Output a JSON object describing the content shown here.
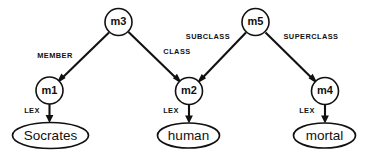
{
  "diagram": {
    "background_color": "#ffffff",
    "stroke_color": "#111111",
    "concept_nodes": [
      {
        "id": "m3",
        "label": "m3",
        "cx": 118.5,
        "cy": 22,
        "r": 13.5
      },
      {
        "id": "m5",
        "label": "m5",
        "cx": 255.5,
        "cy": 22,
        "r": 13.5
      },
      {
        "id": "m1",
        "label": "m1",
        "cx": 49.5,
        "cy": 90.5,
        "r": 13.5
      },
      {
        "id": "m2",
        "label": "m2",
        "cx": 189.0,
        "cy": 91.0,
        "r": 13.5
      },
      {
        "id": "m4",
        "label": "m4",
        "cx": 325.0,
        "cy": 91.0,
        "r": 13.5
      }
    ],
    "lexical_nodes": [
      {
        "id": "socrates",
        "label": "Socrates",
        "cx": 50.5,
        "cy": 135.5,
        "rx": 38,
        "ry": 13
      },
      {
        "id": "human",
        "label": "human",
        "cx": 188.5,
        "cy": 135.5,
        "rx": 31,
        "ry": 12.5
      },
      {
        "id": "mortal",
        "label": "mortal",
        "cx": 324.5,
        "cy": 135.5,
        "rx": 31,
        "ry": 12.5
      }
    ],
    "edges": [
      {
        "id": "m3-m1",
        "label": "MEMBER",
        "from": "m3",
        "to": "m1",
        "label_x": 55,
        "label_y": 56
      },
      {
        "id": "m3-m2",
        "label": "CLASS",
        "from": "m3",
        "to": "m2",
        "label_x": 177,
        "label_y": 52
      },
      {
        "id": "m5-m2",
        "label": "SUBCLASS",
        "from": "m5",
        "to": "m2",
        "label_x": 208,
        "label_y": 37
      },
      {
        "id": "m5-m4",
        "label": "SUPERCLASS",
        "from": "m5",
        "to": "m4",
        "label_x": 311,
        "label_y": 37
      },
      {
        "id": "m1-socrates",
        "label": "LEX",
        "from": "m1",
        "to": "socrates",
        "label_x": 32,
        "label_y": 111
      },
      {
        "id": "m2-human",
        "label": "LEX",
        "from": "m2",
        "to": "human",
        "label_x": 171,
        "label_y": 111
      },
      {
        "id": "m4-mortal",
        "label": "LEX",
        "from": "m4",
        "to": "mortal",
        "label_x": 307,
        "label_y": 111
      }
    ]
  }
}
